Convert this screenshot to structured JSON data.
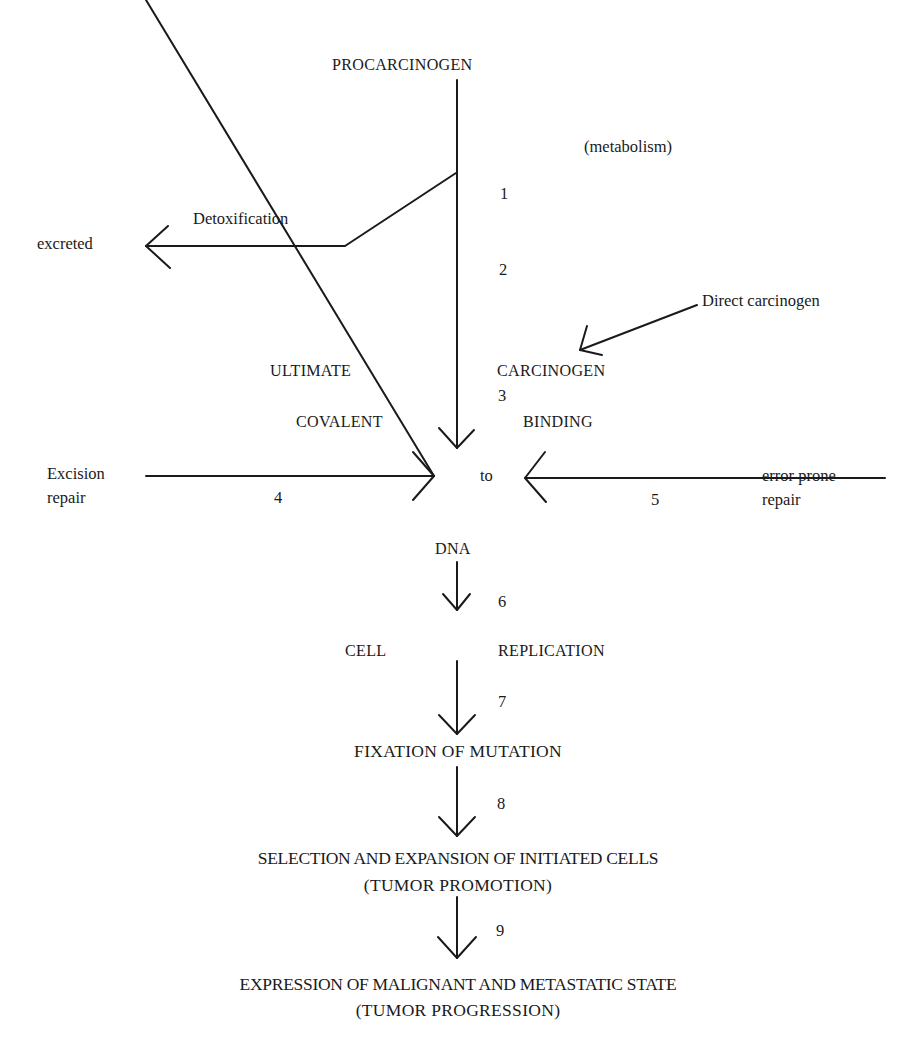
{
  "nodes": {
    "procarcinogen": "PROCARCINOGEN",
    "metabolism": "(metabolism)",
    "detoxification": "Detoxification",
    "excreted": "excreted",
    "direct_carcinogen": "Direct carcinogen",
    "ultimate": "ULTIMATE",
    "carcinogen": "CARCINOGEN",
    "covalent": "COVALENT",
    "binding": "BINDING",
    "to": "to",
    "excision_line1": "Excision",
    "excision_line2": "repair",
    "error_line1": "error prone",
    "error_line2": "repair",
    "dna": "DNA",
    "cell": "CELL",
    "replication": "REPLICATION",
    "fixation": "FIXATION OF MUTATION",
    "selection": "SELECTION AND EXPANSION OF INITIATED CELLS",
    "tumor_promotion": "(TUMOR PROMOTION)",
    "expression": "EXPRESSION OF MALIGNANT AND METASTATIC STATE",
    "tumor_progression": "(TUMOR PROGRESSION)"
  },
  "steps": [
    "1",
    "2",
    "3",
    "4",
    "5",
    "6",
    "7",
    "8",
    "9"
  ],
  "colors": {
    "ink": "#1a1a1a",
    "background": "#ffffff"
  }
}
